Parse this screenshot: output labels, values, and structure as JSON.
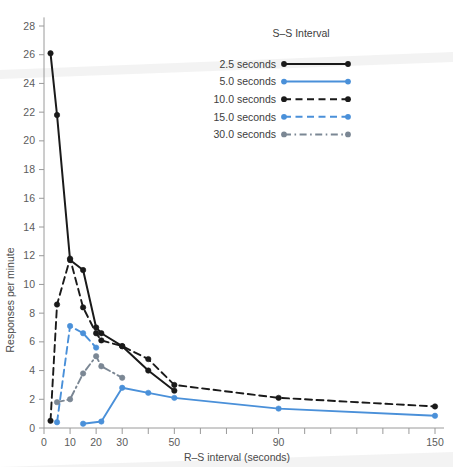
{
  "chart_data": {
    "type": "line",
    "title": "",
    "xlabel": "R–S interval (seconds)",
    "ylabel": "Responses per minute",
    "xlim": [
      0,
      155
    ],
    "ylim": [
      0,
      28.8
    ],
    "grid": false,
    "legend_position": "upper-right",
    "legend_title": "S–S Interval",
    "x_ticks": [
      0,
      10,
      20,
      30,
      40,
      50,
      60,
      70,
      80,
      90,
      100,
      110,
      120,
      130,
      140,
      150
    ],
    "x_tick_labels": [
      "0",
      "10",
      "20",
      "30",
      "",
      "50",
      "",
      "",
      "",
      "90",
      "",
      "",
      "",
      "",
      "",
      "150"
    ],
    "y_ticks": [
      0,
      2,
      4,
      6,
      8,
      10,
      12,
      14,
      16,
      18,
      20,
      22,
      24,
      26,
      28
    ],
    "y_tick_labels": [
      "0",
      "2",
      "4",
      "6",
      "8",
      "10",
      "12",
      "14",
      "16",
      "18",
      "20",
      "22",
      "24",
      "26",
      "28"
    ],
    "series": [
      {
        "name": "2.5 seconds",
        "color": "#1a1a1a",
        "dash": "solid",
        "x": [
          2.5,
          5,
          10,
          15,
          20,
          22,
          30,
          40,
          50
        ],
        "y": [
          26.1,
          21.8,
          11.7,
          11.0,
          7.0,
          6.6,
          5.7,
          4.0,
          2.6
        ]
      },
      {
        "name": "5.0 seconds",
        "color": "#4a90d9",
        "dash": "solid",
        "x": [
          15,
          22,
          30,
          40,
          50,
          90,
          150
        ],
        "y": [
          0.3,
          0.45,
          2.8,
          2.45,
          2.1,
          1.35,
          0.85
        ]
      },
      {
        "name": "10.0 seconds",
        "color": "#1a1a1a",
        "dash": "dashed",
        "x": [
          2.5,
          5,
          10,
          15,
          20,
          22,
          30,
          40,
          50,
          90,
          150
        ],
        "y": [
          0.5,
          8.6,
          11.8,
          8.4,
          6.6,
          6.1,
          5.7,
          4.8,
          3.0,
          2.1,
          1.5
        ]
      },
      {
        "name": "15.0 seconds",
        "color": "#4a90d9",
        "dash": "dashed",
        "x": [
          5,
          10,
          15,
          20
        ],
        "y": [
          0.4,
          7.1,
          6.6,
          5.6
        ]
      },
      {
        "name": "30.0 seconds",
        "color": "#7b8794",
        "dash": "dashdot",
        "x": [
          5,
          10,
          15,
          20,
          22,
          30
        ],
        "y": [
          1.8,
          2.0,
          3.8,
          5.0,
          4.3,
          3.5
        ]
      }
    ]
  },
  "legend": {
    "title": "S–S Interval",
    "entries": [
      {
        "label": "2.5 seconds"
      },
      {
        "label": "5.0 seconds"
      },
      {
        "label": "10.0 seconds"
      },
      {
        "label": "15.0 seconds"
      },
      {
        "label": "30.0 seconds"
      }
    ]
  },
  "axes": {
    "x_title": "R–S interval (seconds)",
    "y_title": "Responses per minute"
  }
}
